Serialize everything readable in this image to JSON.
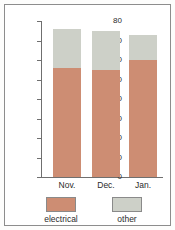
{
  "chart_data": {
    "type": "bar",
    "subtype": "stacked",
    "title": "",
    "xlabel": "",
    "ylabel": "",
    "categories": [
      "Nov.",
      "Dec.",
      "Jan."
    ],
    "series": [
      {
        "name": "electrical",
        "color": "#cd8d73",
        "values": [
          56,
          55,
          60
        ]
      },
      {
        "name": "other",
        "color": "#cdd0c8",
        "values": [
          20,
          20,
          13
        ]
      }
    ],
    "totals": [
      76,
      75,
      73
    ],
    "ylim": [
      0,
      80
    ],
    "yticks": [
      0,
      10,
      20,
      30,
      40,
      50,
      60,
      70,
      80
    ],
    "ytick_labels": [
      "0",
      "10",
      "20",
      "30",
      "40",
      "50",
      "60",
      "70",
      "80"
    ],
    "grid": false,
    "legend_position": "bottom",
    "legend": [
      "electrical",
      "other"
    ]
  },
  "colors": {
    "electrical": "#cd8d73",
    "other": "#cdd0c8",
    "axis": "#6f6f6f",
    "frame": "#8d8d8d",
    "text": "#2b2b2b",
    "background": "#ffffff"
  }
}
